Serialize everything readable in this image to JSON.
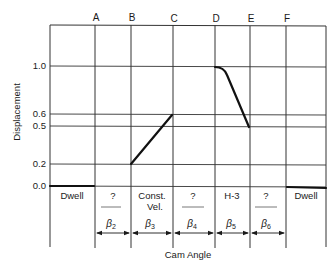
{
  "header": {
    "corner_text": ""
  },
  "columns": {
    "labels": [
      "A",
      "B",
      "C",
      "D",
      "E",
      "F"
    ]
  },
  "yaxis": {
    "title": "Displacement",
    "ticks": [
      "1.0",
      "0.6",
      "0.5",
      "0.2",
      "0.0"
    ]
  },
  "xaxis": {
    "title": "Cam Angle"
  },
  "segments": [
    {
      "name": "Dwell",
      "line1": "Dwell",
      "line2": "",
      "beta": ""
    },
    {
      "name": "unknown-2",
      "line1": "?",
      "line2": "",
      "beta": "β",
      "beta_sub": "2"
    },
    {
      "name": "const-vel",
      "line1": "Const.",
      "line2": "Vel.",
      "beta": "β",
      "beta_sub": "3"
    },
    {
      "name": "unknown-4",
      "line1": "?",
      "line2": "",
      "beta": "β",
      "beta_sub": "4"
    },
    {
      "name": "h-3",
      "line1": "H-3",
      "line2": "",
      "beta": "β",
      "beta_sub": "5"
    },
    {
      "name": "unknown-6",
      "line1": "?",
      "line2": "",
      "beta": "β",
      "beta_sub": "6"
    },
    {
      "name": "Dwell-end",
      "line1": "Dwell",
      "line2": "",
      "beta": ""
    }
  ],
  "colors": {
    "ink": "#1a1a1a",
    "grid": "#333333",
    "background": "#ffffff"
  }
}
